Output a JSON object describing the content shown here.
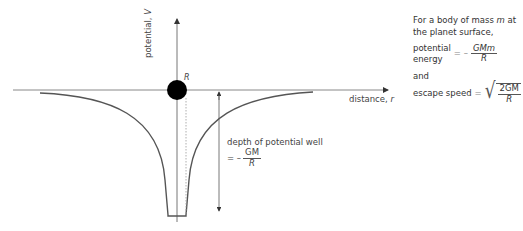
{
  "diagram": {
    "y_axis_label": "potential, ",
    "y_axis_symbol": "V",
    "x_axis_label": "distance, ",
    "x_axis_symbol": "r",
    "planet_radius_label": "R",
    "depth_label": "depth of potential well",
    "depth_formula": {
      "prefix": "= –",
      "numerator": "GM",
      "denominator": "R"
    }
  },
  "side_panel": {
    "intro_1": "For a body of mass ",
    "intro_m": "m",
    "intro_2": " at the planet surface,",
    "pe_label_1": "potential",
    "pe_label_2": "energy",
    "pe_equals": "= –",
    "pe_numerator": "GMm",
    "pe_denominator": "R",
    "and_label": "and",
    "escape_label": "escape speed",
    "escape_equals": "=",
    "escape_numerator": "2GM",
    "escape_denominator": "R"
  }
}
